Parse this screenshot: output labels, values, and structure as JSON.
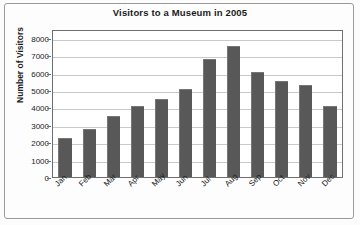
{
  "chart_data": {
    "type": "bar",
    "title": "Visitors to a Museum in 2005",
    "xlabel": "",
    "ylabel": "Number of Visitors",
    "categories": [
      "Jan",
      "Feb",
      "Mar",
      "Apr",
      "May",
      "Jun",
      "Jul",
      "Aug",
      "Sep",
      "Oct",
      "Nov",
      "Dec"
    ],
    "values": [
      2250,
      2750,
      3500,
      4050,
      4500,
      5050,
      6750,
      7500,
      6050,
      5500,
      5300,
      4050
    ],
    "ylim": [
      0,
      8500
    ],
    "yticks": [
      0,
      1000,
      2000,
      3000,
      4000,
      5000,
      6000,
      7000,
      8000
    ],
    "ytick_labels": [
      "0",
      "1000",
      "2000",
      "3000",
      "4000",
      "5000",
      "6000",
      "7000",
      "8000"
    ],
    "grid": true,
    "legend": null,
    "bar_color": "#585858",
    "plot_background": "#ffffff",
    "gridline_color": "#c9c9c9",
    "axis_color": "#6f6f6f"
  }
}
